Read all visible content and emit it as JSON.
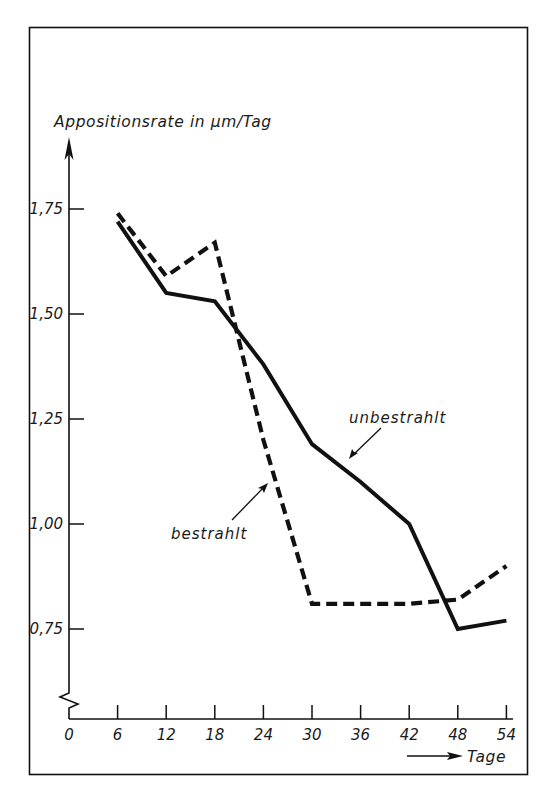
{
  "chart_data": {
    "type": "line",
    "title": "",
    "ylabel": "Appositionsrate in µm/Tag",
    "xlabel": "Tage",
    "x_ticks": [
      0,
      6,
      12,
      18,
      24,
      30,
      36,
      42,
      48,
      54
    ],
    "x_tick_labels": [
      "0",
      "6",
      "12",
      "18",
      "24",
      "30",
      "36",
      "42",
      "48",
      "54"
    ],
    "y_ticks": [
      0.75,
      1.0,
      1.25,
      1.5,
      1.75
    ],
    "y_tick_labels": [
      "0,75",
      "1,00",
      "1,25",
      "1,50",
      "1,75"
    ],
    "xlim": [
      0,
      54
    ],
    "ylim_visible": [
      0.6,
      1.9
    ],
    "y_axis_break": true,
    "grid": false,
    "legend": "inline-annotations",
    "x": [
      6,
      12,
      18,
      24,
      30,
      36,
      42,
      48,
      54
    ],
    "series": [
      {
        "name": "unbestrahlt",
        "style": "solid",
        "values": [
          1.72,
          1.55,
          1.53,
          1.38,
          1.19,
          1.1,
          1.0,
          0.75,
          0.77
        ]
      },
      {
        "name": "bestrahlt",
        "style": "dashed",
        "values": [
          1.74,
          1.59,
          1.67,
          1.2,
          0.81,
          0.81,
          0.81,
          0.82,
          0.9
        ]
      }
    ],
    "annotations": [
      {
        "text": "unbestrahlt",
        "points_to": "solid line near x=36"
      },
      {
        "text": "bestrahlt",
        "points_to": "dashed line near x=24"
      }
    ]
  },
  "labels": {
    "y_axis_title": "Appositionsrate in µm/Tag",
    "x_axis_title": "Tage",
    "series_solid": "unbestrahlt",
    "series_dashed": "bestrahlt"
  },
  "colors": {
    "ink": "#111111",
    "background": "#ffffff"
  }
}
